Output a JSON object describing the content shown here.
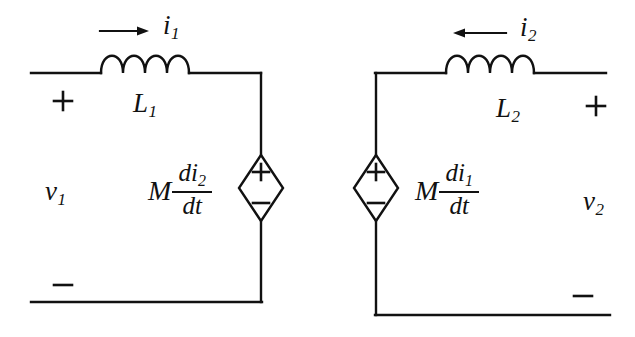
{
  "figure": {
    "type": "circuit-diagram",
    "background_color": "#ffffff",
    "line_color": "#111111"
  },
  "left_circuit": {
    "current_label": "i",
    "current_subscript": "1",
    "current_arrow_direction": "right",
    "inductor_label": "L",
    "inductor_subscript": "1",
    "port_plus": "+",
    "port_minus": "−",
    "voltage_label": "v",
    "voltage_subscript": "1",
    "source_expression": {
      "coefficient": "M",
      "numerator": "di",
      "numerator_subscript": "2",
      "denominator": "dt"
    },
    "source_terminal_top": "+",
    "source_terminal_bottom": "−"
  },
  "right_circuit": {
    "current_label": "i",
    "current_subscript": "2",
    "current_arrow_direction": "left",
    "inductor_label": "L",
    "inductor_subscript": "2",
    "port_plus": "+",
    "port_minus": "−",
    "voltage_label": "v",
    "voltage_subscript": "2",
    "source_expression": {
      "coefficient": "M",
      "numerator": "di",
      "numerator_subscript": "1",
      "denominator": "dt"
    },
    "source_terminal_top": "+",
    "source_terminal_bottom": "−"
  }
}
